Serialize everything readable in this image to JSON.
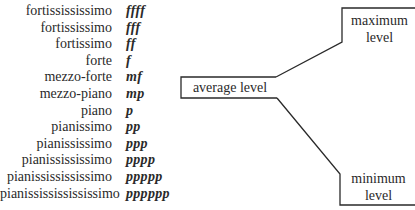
{
  "dynamics": [
    {
      "name": "fortissississimo",
      "mark": "ffff"
    },
    {
      "name": "fortississimo",
      "mark": "fff"
    },
    {
      "name": "fortissimo",
      "mark": "ff"
    },
    {
      "name": "forte",
      "mark": "f"
    },
    {
      "name": "mezzo-forte",
      "mark": "mf"
    },
    {
      "name": "mezzo-piano",
      "mark": "mp"
    },
    {
      "name": "piano",
      "mark": "p"
    },
    {
      "name": "pianissimo",
      "mark": "pp"
    },
    {
      "name": "pianississimo",
      "mark": "ppp"
    },
    {
      "name": "pianissississimo",
      "mark": "pppp"
    },
    {
      "name": "pianississississimo",
      "mark": "ppppp"
    },
    {
      "name": "pianissississississimo",
      "mark": "pppppp"
    }
  ],
  "levels": {
    "average": "average level",
    "maximum_line1": "maximum",
    "maximum_line2": "level",
    "minimum_line1": "minimum",
    "minimum_line2": "level"
  },
  "colors": {
    "ink": "#2a2a2a",
    "background": "#ffffff"
  }
}
